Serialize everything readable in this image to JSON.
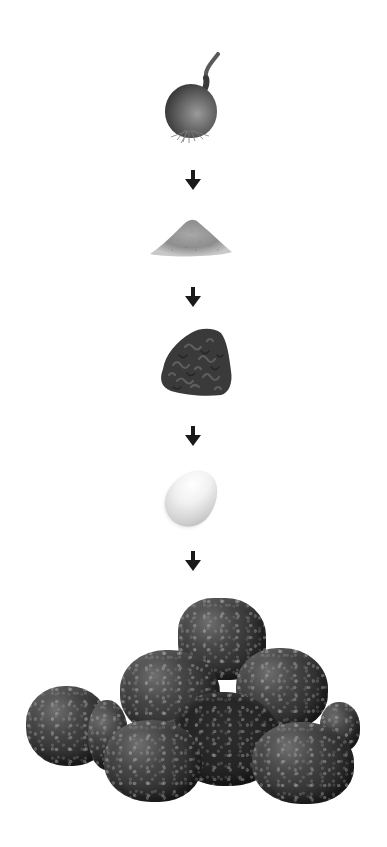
{
  "figure": {
    "type": "process-flow",
    "direction": "top-to-bottom",
    "arrow_color": "#1a1a1a",
    "background": "#ffffff",
    "steps": [
      {
        "name": "onion",
        "icon": "onion-icon"
      },
      {
        "name": "breadcrumbs",
        "icon": "powder-pile-icon"
      },
      {
        "name": "ground-meat",
        "icon": "ground-meat-icon"
      },
      {
        "name": "egg",
        "icon": "egg-icon"
      },
      {
        "name": "meatballs",
        "icon": "meatballs-icon"
      }
    ],
    "arrows": [
      {
        "icon": "arrow-down-icon"
      },
      {
        "icon": "arrow-down-icon"
      },
      {
        "icon": "arrow-down-icon"
      },
      {
        "icon": "arrow-down-icon"
      }
    ]
  }
}
